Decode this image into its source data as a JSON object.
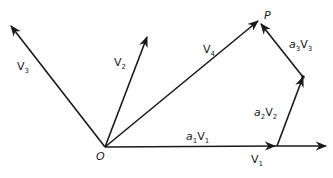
{
  "diagram": {
    "type": "vector-decomposition",
    "origin_label": "O",
    "point_label": "P",
    "vectors": [
      {
        "id": "v1",
        "base": "V",
        "sub": "1"
      },
      {
        "id": "v2",
        "base": "V",
        "sub": "2"
      },
      {
        "id": "v3",
        "base": "V",
        "sub": "3"
      },
      {
        "id": "v4",
        "base": "V",
        "sub": "4"
      }
    ],
    "components": [
      {
        "id": "a1v1",
        "coef": "a",
        "coef_sub": "1",
        "base": "V",
        "sub": "1"
      },
      {
        "id": "a2v2",
        "coef": "a",
        "coef_sub": "2",
        "base": "V",
        "sub": "2"
      },
      {
        "id": "a3v3",
        "coef": "a",
        "coef_sub": "3",
        "base": "V",
        "sub": "3"
      }
    ],
    "colors": {
      "ink": "#1a1a1a",
      "background": "#ffffff"
    }
  }
}
